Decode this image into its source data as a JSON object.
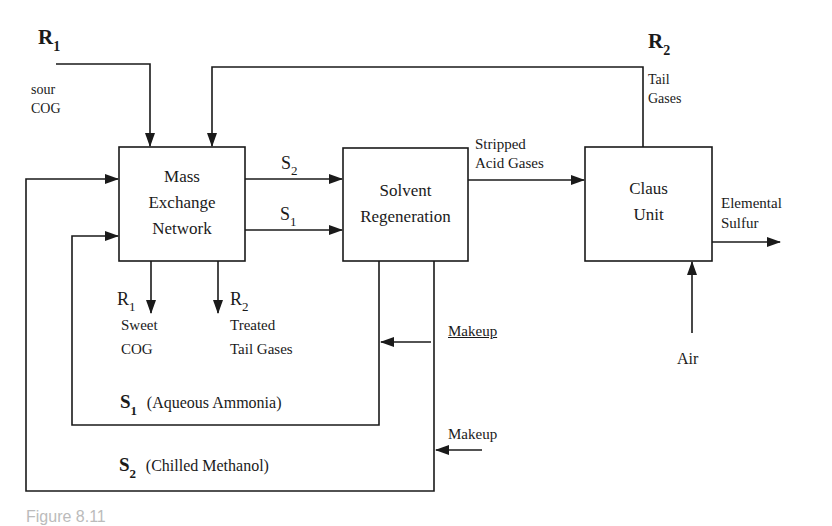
{
  "diagram": {
    "units": [
      {
        "id": "men",
        "line1": "Mass",
        "line2": "Exchange",
        "line3": "Network"
      },
      {
        "id": "regen",
        "line1": "Solvent",
        "line2": "Regeneration"
      },
      {
        "id": "claus",
        "line1": "Claus",
        "line2": "Unit"
      }
    ],
    "streams": {
      "r1_in": {
        "symbol": "R",
        "sub": "1",
        "line1": "sour",
        "line2": "COG"
      },
      "r2_tail": {
        "symbol": "R",
        "sub": "2",
        "line1": "Tail",
        "line2": "Gases"
      },
      "s2_out": {
        "symbol": "S",
        "sub": "2"
      },
      "s1_out": {
        "symbol": "S",
        "sub": "1"
      },
      "stripped": {
        "line1": "Stripped",
        "line2": "Acid Gases"
      },
      "sulfur": {
        "line1": "Elemental",
        "line2": "Sulfur"
      },
      "air": {
        "label": "Air"
      },
      "r1_out": {
        "symbol": "R",
        "sub": "1",
        "line1": "Sweet",
        "line2": "COG"
      },
      "r2_out": {
        "symbol": "R",
        "sub": "2",
        "line1": "Treated",
        "line2": "Tail Gases"
      },
      "makeup1": {
        "label": "Makeup"
      },
      "makeup2": {
        "label": "Makeup"
      },
      "s1_loop": {
        "symbol": "S",
        "sub": "1",
        "desc": "(Aqueous Ammonia)"
      },
      "s2_loop": {
        "symbol": "S",
        "sub": "2",
        "desc": "(Chilled Methanol)"
      }
    },
    "caption": "Figure 8.11",
    "colors": {
      "line": "#1a1a1a",
      "background": "#ffffff"
    }
  }
}
